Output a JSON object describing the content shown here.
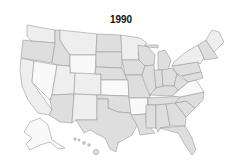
{
  "title": "1990",
  "legend": {
    "shade_light": "#f9f9f9",
    "shade_mid": "#eeeeee",
    "shade_dark": "#dedede",
    "border": "#9a9a9a"
  },
  "states": [
    {
      "id": "WA",
      "shade": "mid"
    },
    {
      "id": "OR",
      "shade": "dark"
    },
    {
      "id": "CA",
      "shade": "mid"
    },
    {
      "id": "NV",
      "shade": "light"
    },
    {
      "id": "ID",
      "shade": "dark"
    },
    {
      "id": "MT",
      "shade": "mid"
    },
    {
      "id": "WY",
      "shade": "light"
    },
    {
      "id": "UT",
      "shade": "mid"
    },
    {
      "id": "AZ",
      "shade": "dark"
    },
    {
      "id": "CO",
      "shade": "mid"
    },
    {
      "id": "NM",
      "shade": "mid"
    },
    {
      "id": "ND",
      "shade": "dark"
    },
    {
      "id": "SD",
      "shade": "dark"
    },
    {
      "id": "NE",
      "shade": "dark"
    },
    {
      "id": "KS",
      "shade": "light"
    },
    {
      "id": "OK",
      "shade": "dark"
    },
    {
      "id": "TX",
      "shade": "dark"
    },
    {
      "id": "MN",
      "shade": "mid"
    },
    {
      "id": "IA",
      "shade": "dark"
    },
    {
      "id": "MO",
      "shade": "dark"
    },
    {
      "id": "AR",
      "shade": "light"
    },
    {
      "id": "LA",
      "shade": "dark"
    },
    {
      "id": "WI",
      "shade": "dark"
    },
    {
      "id": "IL",
      "shade": "dark"
    },
    {
      "id": "MI",
      "shade": "dark"
    },
    {
      "id": "IN",
      "shade": "dark"
    },
    {
      "id": "OH",
      "shade": "dark"
    },
    {
      "id": "KY",
      "shade": "dark"
    },
    {
      "id": "TN",
      "shade": "dark"
    },
    {
      "id": "MS",
      "shade": "dark"
    },
    {
      "id": "AL",
      "shade": "dark"
    },
    {
      "id": "GA",
      "shade": "dark"
    },
    {
      "id": "FL",
      "shade": "dark"
    },
    {
      "id": "SC",
      "shade": "dark"
    },
    {
      "id": "NC",
      "shade": "dark"
    },
    {
      "id": "VA",
      "shade": "light"
    },
    {
      "id": "WV",
      "shade": "dark"
    },
    {
      "id": "PA",
      "shade": "dark"
    },
    {
      "id": "NY",
      "shade": "mid"
    },
    {
      "id": "NE_states",
      "shade": "dark"
    },
    {
      "id": "ME",
      "shade": "mid"
    },
    {
      "id": "AK",
      "shade": "light"
    },
    {
      "id": "HI",
      "shade": "dark"
    }
  ]
}
